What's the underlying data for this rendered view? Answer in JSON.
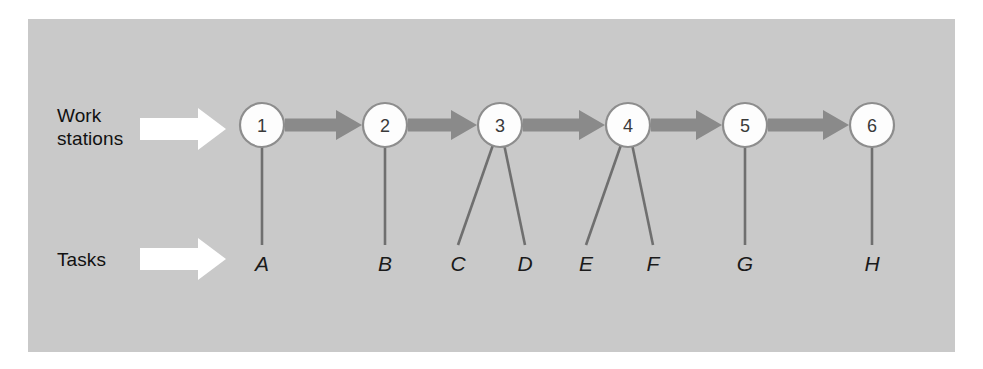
{
  "figure": {
    "background_color": "#ffffff",
    "panel_color": "#c9c9c9",
    "node_fill": "#fdfdfd",
    "node_stroke": "#8d8d8d",
    "flow_arrow_color": "#8a8a8a",
    "connector_color": "#6f6f6f",
    "pointer_arrow_color": "#ffffff",
    "label_color": "#111111"
  },
  "labels": {
    "workstations": "Work\nstations",
    "tasks": "Tasks"
  },
  "pointers": [
    {
      "name": "workstations-pointer",
      "direction": "right",
      "color": "#ffffff"
    },
    {
      "name": "tasks-pointer",
      "direction": "right",
      "color": "#ffffff"
    }
  ],
  "chart_data": {
    "type": "diagram",
    "xlabel": "",
    "ylabel": "",
    "rows": [
      "Work stations",
      "Tasks"
    ],
    "nodes": [
      {
        "id": "1",
        "label": "1",
        "x": 262,
        "y": 125,
        "r": 22
      },
      {
        "id": "2",
        "label": "2",
        "x": 385,
        "y": 125,
        "r": 22
      },
      {
        "id": "3",
        "label": "3",
        "x": 500,
        "y": 125,
        "r": 22
      },
      {
        "id": "4",
        "label": "4",
        "x": 628,
        "y": 125,
        "r": 22
      },
      {
        "id": "5",
        "label": "5",
        "x": 745,
        "y": 125,
        "r": 22
      },
      {
        "id": "6",
        "label": "6",
        "x": 872,
        "y": 125,
        "r": 22
      }
    ],
    "flow": [
      {
        "from": "1",
        "to": "2"
      },
      {
        "from": "2",
        "to": "3"
      },
      {
        "from": "3",
        "to": "4"
      },
      {
        "from": "4",
        "to": "5"
      },
      {
        "from": "5",
        "to": "6"
      }
    ],
    "tasks": [
      {
        "id": "A",
        "label": "A",
        "x": 262,
        "y": 263,
        "station": "1"
      },
      {
        "id": "B",
        "label": "B",
        "x": 385,
        "y": 263,
        "station": "2"
      },
      {
        "id": "C",
        "label": "C",
        "x": 458,
        "y": 263,
        "station": "3"
      },
      {
        "id": "D",
        "label": "D",
        "x": 525,
        "y": 263,
        "station": "3"
      },
      {
        "id": "E",
        "label": "E",
        "x": 586,
        "y": 263,
        "station": "4"
      },
      {
        "id": "F",
        "label": "F",
        "x": 653,
        "y": 263,
        "station": "4"
      },
      {
        "id": "G",
        "label": "G",
        "x": 745,
        "y": 263,
        "station": "5"
      },
      {
        "id": "H",
        "label": "H",
        "x": 872,
        "y": 263,
        "station": "6"
      }
    ],
    "assignments": [
      {
        "station": "1",
        "tasks": [
          "A"
        ]
      },
      {
        "station": "2",
        "tasks": [
          "B"
        ]
      },
      {
        "station": "3",
        "tasks": [
          "C",
          "D"
        ]
      },
      {
        "station": "4",
        "tasks": [
          "E",
          "F"
        ]
      },
      {
        "station": "5",
        "tasks": [
          "G"
        ]
      },
      {
        "station": "6",
        "tasks": [
          "H"
        ]
      }
    ]
  }
}
